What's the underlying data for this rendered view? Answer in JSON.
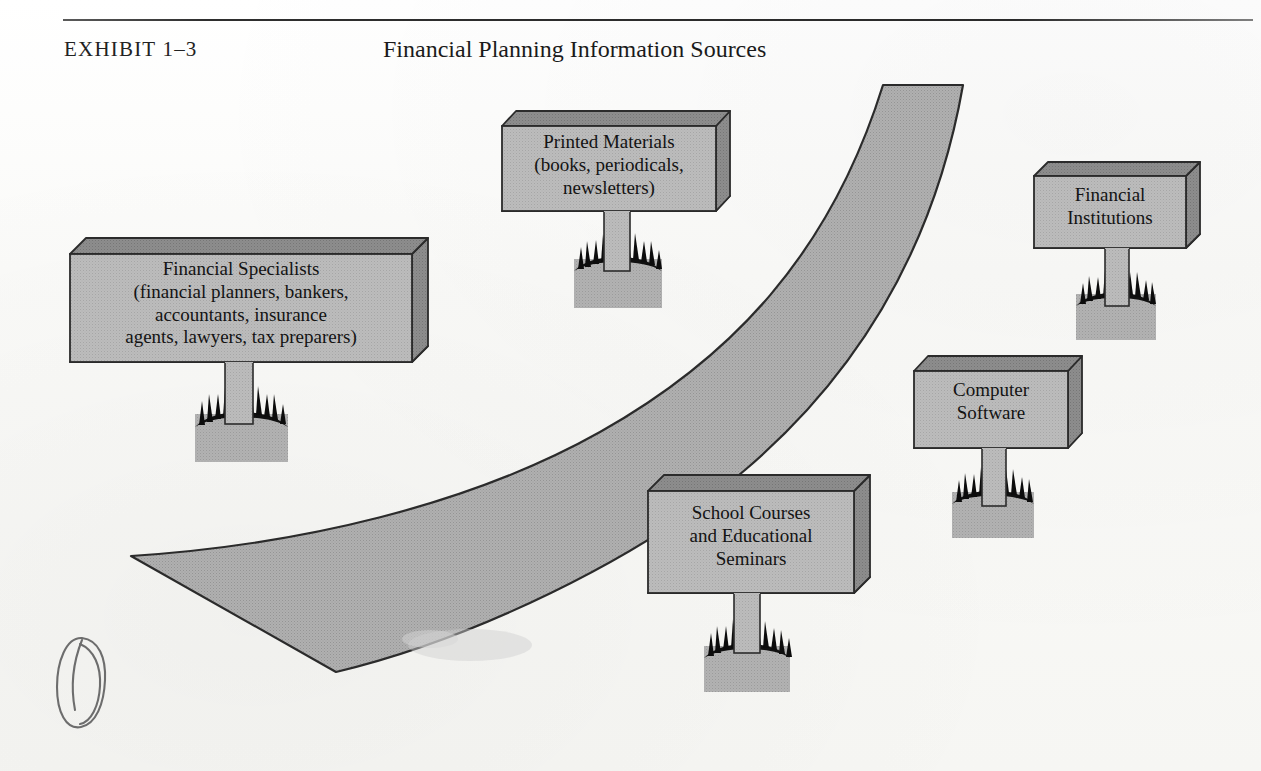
{
  "exhibit": {
    "label": "EXHIBIT 1–3",
    "title": "Financial Planning Information Sources"
  },
  "colors": {
    "page_background": "#fbfbf9",
    "sign_face": "#b9b9b9",
    "sign_side": "#8f8f8f",
    "sign_underside": "#9a9a9a",
    "road_fill": "#acacac",
    "outline": "#2b2b2b",
    "grass": "#101010",
    "mound": "#aeaeae",
    "text": "#131313",
    "rule": "#2e2e2e"
  },
  "diagram": {
    "type": "illustration",
    "road": {
      "name": "winding-road",
      "direction": "from lower-left to upper-right"
    },
    "signs": [
      {
        "id": "printed-materials",
        "name": "Printed Materials",
        "lines": [
          "Printed Materials",
          "(books, periodicals,",
          "newsletters)"
        ],
        "text": "Printed Materials\n(books, periodicals,\nnewsletters)"
      },
      {
        "id": "financial-specialists",
        "name": "Financial Specialists",
        "lines": [
          "Financial Specialists",
          "(financial planners, bankers,",
          "accountants, insurance",
          "agents, lawyers, tax preparers)"
        ],
        "text": "Financial Specialists\n(financial planners, bankers,\naccountants, insurance\nagents, lawyers, tax preparers)"
      },
      {
        "id": "financial-institutions",
        "name": "Financial Institutions",
        "lines": [
          "Financial",
          "Institutions"
        ],
        "text": "Financial\nInstitutions"
      },
      {
        "id": "computer-software",
        "name": "Computer Software",
        "lines": [
          "Computer",
          "Software"
        ],
        "text": "Computer\nSoftware"
      },
      {
        "id": "school-courses",
        "name": "School Courses and Educational Seminars",
        "lines": [
          "School Courses",
          "and Educational",
          "Seminars"
        ],
        "text": "School Courses\nand Educational\nSeminars"
      }
    ],
    "annotation": {
      "id": "hand-drawn-doodle",
      "name": "pen-scribble-loop",
      "text": ""
    }
  }
}
